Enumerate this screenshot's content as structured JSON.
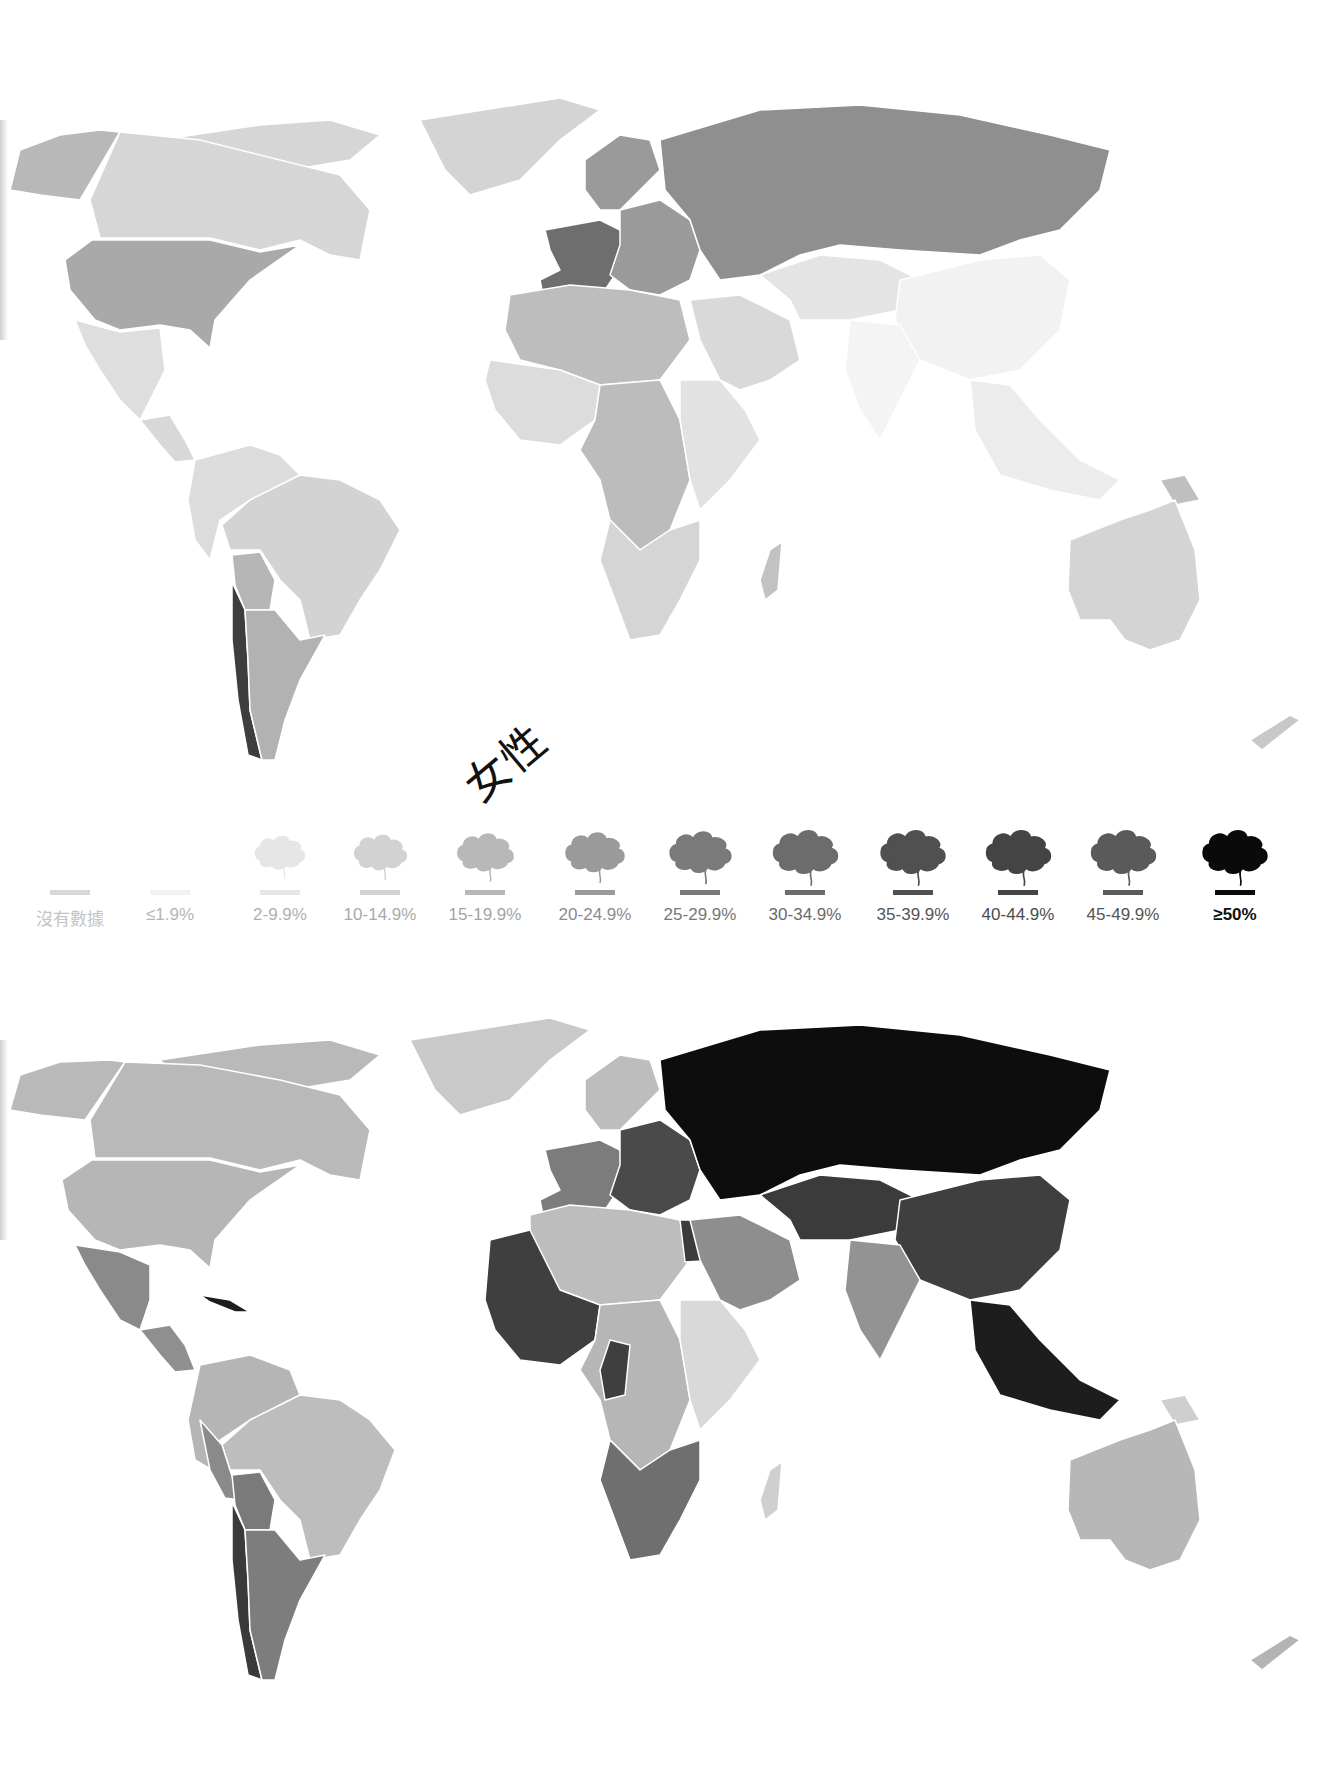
{
  "maps": [
    {
      "id": "female",
      "label": "女性",
      "regions": {
        "canada": "#d6d6d6",
        "alaska": "#b8b8b8",
        "usa": "#a9a9a9",
        "greenland": "#d4d4d4",
        "mexico": "#dedede",
        "central_america": "#d8d8d8",
        "south_america_north": "#dcdcdc",
        "brazil": "#d3d3d3",
        "bolivia": "#b6b6b6",
        "chile": "#3e3e3e",
        "argentina": "#b2b2b2",
        "europe_west": "#6e6e6e",
        "europe_east": "#9a9a9a",
        "russia": "#8f8f8f",
        "north_africa": "#bdbdbd",
        "west_africa": "#dcdcdc",
        "central_africa": "#bcbcbc",
        "east_africa": "#e2e2e2",
        "southern_africa": "#d5d5d5",
        "madagascar": "#c2c2c2",
        "middle_east": "#d9d9d9",
        "central_asia": "#e4e4e4",
        "china": "#f2f2f2",
        "india": "#f4f4f4",
        "southeast_asia": "#ececec",
        "australia": "#d4d4d4",
        "new_zealand": "#c8c8c8",
        "png": "#bfbfbf"
      }
    },
    {
      "id": "male",
      "label": "男性",
      "regions": {
        "canada": "#b9b9b9",
        "alaska": "#b9b9b9",
        "usa": "#b6b6b6",
        "greenland": "#c9c9c9",
        "mexico": "#8a8a8a",
        "central_america": "#8f8f8f",
        "south_america_north": "#b5b5b5",
        "brazil": "#bdbdbd",
        "bolivia": "#7a7a7a",
        "chile": "#3a3a3a",
        "argentina": "#7d7d7d",
        "europe_west": "#7c7c7c",
        "europe_east": "#4a4a4a",
        "russia": "#0d0d0d",
        "north_africa": "#bdbdbd",
        "west_africa": "#3f3f3f",
        "central_africa": "#b6b6b6",
        "east_africa": "#d9d9d9",
        "southern_africa": "#6f6f6f",
        "madagascar": "#cfcfcf",
        "middle_east": "#8e8e8e",
        "central_asia": "#3b3b3b",
        "china": "#3f3f3f",
        "india": "#939393",
        "southeast_asia": "#1d1d1d",
        "australia": "#b7b7b7",
        "new_zealand": "#b4b4b4",
        "png": "#cfcfcf"
      }
    }
  ],
  "legend": {
    "items": [
      {
        "label": "沒有數據",
        "color": "#d8d8d8",
        "text_color": "#c4c4c4",
        "cloud": false
      },
      {
        "label": "≤1.9%",
        "color": "#f2f2f2",
        "text_color": "#b5b5b5",
        "cloud": false
      },
      {
        "label": "2-9.9%",
        "color": "#e6e6e6",
        "text_color": "#b0b0b0",
        "cloud": true
      },
      {
        "label": "10-14.9%",
        "color": "#d2d2d2",
        "text_color": "#aaaaaa",
        "cloud": true
      },
      {
        "label": "15-19.9%",
        "color": "#b8b8b8",
        "text_color": "#a4a4a4",
        "cloud": true
      },
      {
        "label": "20-24.9%",
        "color": "#9a9a9a",
        "text_color": "#8c8c8c",
        "cloud": true
      },
      {
        "label": "25-29.9%",
        "color": "#7a7a7a",
        "text_color": "#777777",
        "cloud": true
      },
      {
        "label": "30-34.9%",
        "color": "#6c6c6c",
        "text_color": "#6a6a6a",
        "cloud": true
      },
      {
        "label": "35-39.9%",
        "color": "#505050",
        "text_color": "#555555",
        "cloud": true
      },
      {
        "label": "40-44.9%",
        "color": "#444444",
        "text_color": "#4c4c4c",
        "cloud": true
      },
      {
        "label": "45-49.9%",
        "color": "#5a5a5a",
        "text_color": "#555555",
        "cloud": true
      },
      {
        "label": "≥50%",
        "color": "#0a0a0a",
        "text_color": "#111111",
        "cloud": true
      }
    ]
  }
}
